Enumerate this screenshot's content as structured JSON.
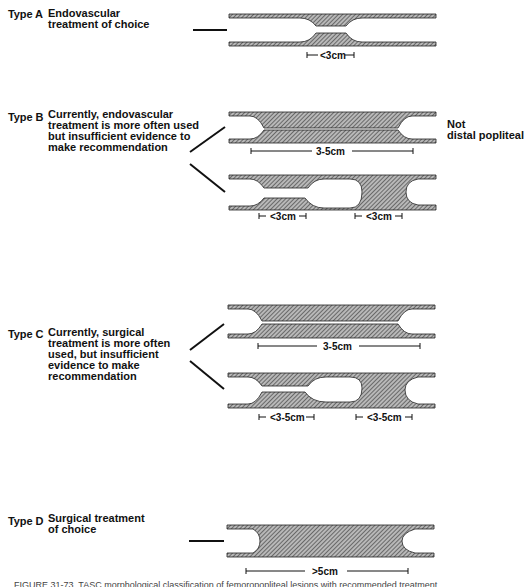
{
  "figure": {
    "types": [
      {
        "id": "A",
        "label": "Type A",
        "description": "Endovascular\ntreatment of choice",
        "lesions": [
          {
            "shape": "short stenosis",
            "measurement": "<3cm"
          }
        ]
      },
      {
        "id": "B",
        "label": "Type B",
        "description": "Currently, endovascular\ntreatment is more often used\nbut insufficient evidence to\nmake recommendation",
        "note": "Not\ndistal popliteal",
        "lesions": [
          {
            "shape": "long stenosis",
            "measurement": "3-5cm"
          },
          {
            "shape": "stenosis + occlusion",
            "measurement": "<3cm"
          },
          {
            "shape": "occlusion",
            "measurement": "<3cm"
          }
        ]
      },
      {
        "id": "C",
        "label": "Type C",
        "description": "Currently, surgical\ntreatment is more often\nused, but insufficient\nevidence to make\nrecommendation",
        "lesions": [
          {
            "shape": "long occlusion",
            "measurement": "3-5cm"
          },
          {
            "shape": "stenosis + occlusion",
            "measurement": "<3-5cm"
          },
          {
            "shape": "occlusion",
            "measurement": "<3-5cm"
          }
        ]
      },
      {
        "id": "D",
        "label": "Type D",
        "description": "Surgical treatment\nof choice",
        "lesions": [
          {
            "shape": "total occlusion",
            "measurement": ">5cm"
          }
        ]
      }
    ],
    "caption": "FIGURE 31-73. TASC morphological classification of femoropopliteal lesions with recommended treatment"
  }
}
